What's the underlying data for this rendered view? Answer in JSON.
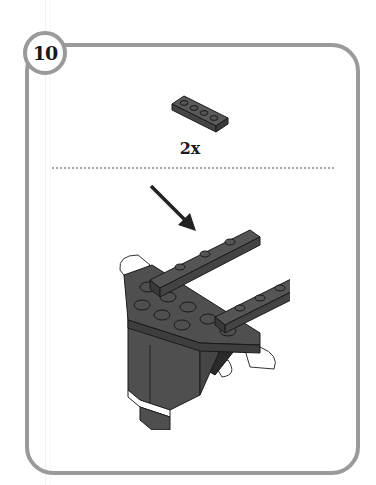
{
  "step": {
    "number": "10"
  },
  "parts_callout": {
    "part_icon": "brick-plate-1x4-icon",
    "part_color": "#555555",
    "quantity_label": "2x"
  },
  "illustration": {
    "arrow_icon": "arrow-down-right-icon",
    "model_icon": "brick-model-assembly-icon",
    "colors": {
      "brick_dark_gray": "#4f4f4f",
      "brick_black": "#2a2a2a",
      "outline": "#1a1a1a",
      "border_gray": "#9a9a9a"
    }
  }
}
